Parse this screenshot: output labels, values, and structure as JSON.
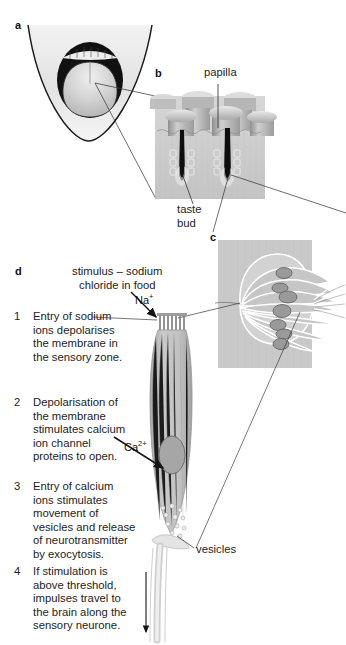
{
  "figure": {
    "background": "#ffffff",
    "width": 346,
    "height": 645
  },
  "panels": [
    {
      "id": "a",
      "letter": "a",
      "name": "open-mouth-tongue",
      "caption": ""
    },
    {
      "id": "b",
      "letter": "b",
      "name": "papillae-section",
      "caption": ""
    },
    {
      "id": "c",
      "letter": "c",
      "name": "taste-bud-detail",
      "caption": ""
    },
    {
      "id": "d",
      "letter": "d",
      "name": "sensory-cell-mechanism",
      "caption": ""
    }
  ],
  "labels": {
    "papilla": "papilla",
    "taste_bud_line1": "taste",
    "taste_bud_line2": "bud",
    "vesicles": "vesicles",
    "stimulus_line1": "stimulus – sodium",
    "stimulus_line2": "chloride in food",
    "sodium_ion": "Na",
    "sodium_ion_charge": "+",
    "calcium_ion": "Ca",
    "calcium_ion_charge": "2+"
  },
  "steps": [
    {
      "number": "1",
      "text": "Entry of sodium ions depolarises the membrane in the sensory zone."
    },
    {
      "number": "2",
      "text": "Depolarisation of the membrane stimulates calcium ion channel proteins to open."
    },
    {
      "number": "3",
      "text": "Entry of calcium ions stimulates movement of vesicles and release of neurotransmitter by exocytosis."
    },
    {
      "number": "4",
      "text": "If stimulation is above threshold, impulses travel to the brain along the sensory neurone."
    }
  ],
  "colors": {
    "ink": "#1d1d1d",
    "leader_line": "#3b3b3b",
    "arrow": "#141414",
    "tissue_light": "#dcdcdc",
    "tissue_mid": "#b9b9b9",
    "tissue_dark": "#9a9a9a",
    "cell_fill": "#c2c2c2",
    "nucleus": "#a2a2a2",
    "cleft_dark": "#1b1b1b",
    "mouth_cavity": "#111111",
    "tongue": "#cfcfcf",
    "neurone": "#e2e2e2"
  }
}
